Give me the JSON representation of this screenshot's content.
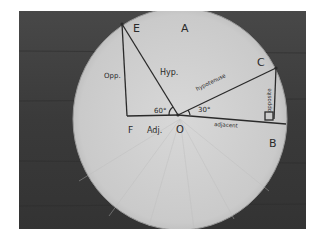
{
  "image": {
    "description": "Photograph of a paper coffee filter on a dark wooden table, with two right triangles drawn in a unit-circle style to illustrate trigonometry",
    "colors": {
      "table": "#3a3a3a",
      "filter": "#cfcfcf",
      "ink": "#2a2a2a"
    }
  },
  "points": {
    "E": "E",
    "A": "A",
    "C": "C",
    "B": "B",
    "F": "F",
    "O": "O"
  },
  "labels": {
    "opp_short": "Opp.",
    "hyp_short": "Hyp.",
    "adj_short": "Adj.",
    "angle_60": "60°",
    "angle_30": "30°",
    "hypotenuse": "hypotenuse",
    "opposite": "opposite",
    "adjacent": "adjacent"
  }
}
